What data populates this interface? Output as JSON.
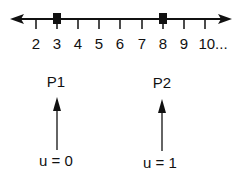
{
  "number_line": {
    "ticks": [
      {
        "label": "2",
        "x": 36
      },
      {
        "label": "3",
        "x": 57
      },
      {
        "label": "4",
        "x": 78
      },
      {
        "label": "5",
        "x": 99
      },
      {
        "label": "6",
        "x": 120
      },
      {
        "label": "7",
        "x": 142
      },
      {
        "label": "8",
        "x": 163
      },
      {
        "label": "9",
        "x": 184
      },
      {
        "label": "10...",
        "x": 205
      }
    ],
    "markers": [
      {
        "at": "3",
        "x": 57
      },
      {
        "at": "8",
        "x": 163
      }
    ]
  },
  "points": [
    {
      "label": "P1",
      "param": "u = 0",
      "x": 56
    },
    {
      "label": "P2",
      "param": "u = 1",
      "x": 162
    }
  ],
  "colors": {
    "ink": "#111111",
    "background": "#ffffff"
  }
}
